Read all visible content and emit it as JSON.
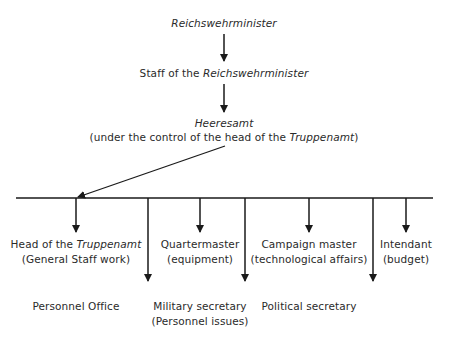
{
  "top": {
    "minister": "Reichswehrminister",
    "staff_prefix": "Staff of the ",
    "staff_name": "Reichswehrminister",
    "heeresamt": "Heeresamt",
    "heeresamt_note_prefix": "(under the control of the head of the ",
    "heeresamt_note_name": "Truppenamt",
    "heeresamt_note_suffix": ")"
  },
  "branches": [
    {
      "line1_prefix": "Head of the ",
      "line1_name": "Truppenamt",
      "line2": "(General Staff work)"
    },
    {
      "line1": "Quartermaster",
      "line2": "(equipment)"
    },
    {
      "line1": "Campaign master",
      "line2": "(technological affairs)"
    },
    {
      "line1": "Intendant",
      "line2": "(budget)"
    }
  ],
  "lower_branches": [
    {
      "line1": "Personnel Office"
    },
    {
      "line1": "Military secretary",
      "line2": "(Personnel issues)"
    },
    {
      "line1": "Political secretary"
    }
  ],
  "colors": {
    "line": "#1a1a1a",
    "text": "#2a2a2a"
  }
}
